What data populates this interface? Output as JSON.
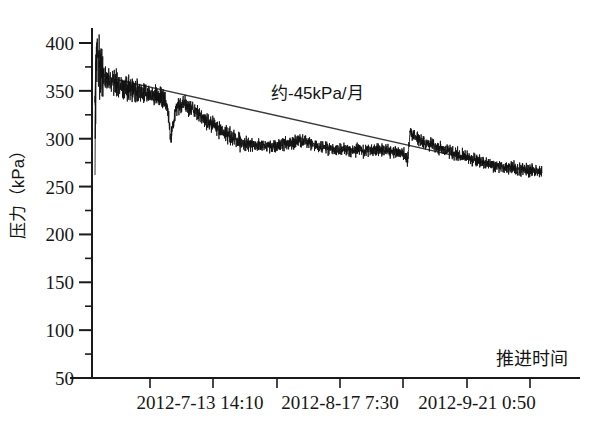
{
  "chart_data": {
    "type": "line",
    "title": "",
    "xlabel": "推进时间",
    "ylabel": "压力（kPa）",
    "ylim": [
      50,
      420
    ],
    "yticks": [
      400,
      350,
      300,
      250,
      200,
      150,
      100,
      50
    ],
    "y_minor_ticks": [
      375,
      325,
      275,
      225,
      175,
      125,
      75
    ],
    "grid": false,
    "legend": null,
    "xticks_labeled": [
      {
        "label": "2012-7-13 14:10",
        "px": 200
      },
      {
        "label": "2012-8-17 7:30",
        "px": 340
      },
      {
        "label": "2012-9-21 0:50",
        "px": 477
      }
    ],
    "x_tick_positions_px": [
      150,
      213,
      277,
      340,
      403,
      467,
      530
    ],
    "annotations": [
      {
        "text": "约-45kPa/月",
        "x_px": 271,
        "y_px": 79
      }
    ],
    "series": [
      {
        "name": "盾构土仓压力",
        "kind": "noisy-timeseries",
        "units": "kPa",
        "description": "初始峰值约390kPa，快速衰减后长期缓慢下降至约265kPa，带高频振荡",
        "control_points": [
          {
            "x_frac": 0.0,
            "value": 330
          },
          {
            "x_frac": 0.004,
            "value": 392
          },
          {
            "x_frac": 0.012,
            "value": 368
          },
          {
            "x_frac": 0.03,
            "value": 360
          },
          {
            "x_frac": 0.06,
            "value": 355
          },
          {
            "x_frac": 0.09,
            "value": 351
          },
          {
            "x_frac": 0.12,
            "value": 347
          },
          {
            "x_frac": 0.15,
            "value": 343
          },
          {
            "x_frac": 0.16,
            "value": 337
          },
          {
            "x_frac": 0.17,
            "value": 302
          },
          {
            "x_frac": 0.18,
            "value": 330
          },
          {
            "x_frac": 0.195,
            "value": 337
          },
          {
            "x_frac": 0.215,
            "value": 332
          },
          {
            "x_frac": 0.24,
            "value": 322
          },
          {
            "x_frac": 0.27,
            "value": 312
          },
          {
            "x_frac": 0.3,
            "value": 303
          },
          {
            "x_frac": 0.32,
            "value": 297
          },
          {
            "x_frac": 0.36,
            "value": 293
          },
          {
            "x_frac": 0.4,
            "value": 292
          },
          {
            "x_frac": 0.44,
            "value": 296
          },
          {
            "x_frac": 0.47,
            "value": 297
          },
          {
            "x_frac": 0.5,
            "value": 292
          },
          {
            "x_frac": 0.54,
            "value": 289
          },
          {
            "x_frac": 0.58,
            "value": 288
          },
          {
            "x_frac": 0.62,
            "value": 288
          },
          {
            "x_frac": 0.66,
            "value": 287
          },
          {
            "x_frac": 0.69,
            "value": 285
          },
          {
            "x_frac": 0.7,
            "value": 279
          },
          {
            "x_frac": 0.705,
            "value": 307
          },
          {
            "x_frac": 0.72,
            "value": 300
          },
          {
            "x_frac": 0.76,
            "value": 292
          },
          {
            "x_frac": 0.8,
            "value": 285
          },
          {
            "x_frac": 0.85,
            "value": 278
          },
          {
            "x_frac": 0.9,
            "value": 272
          },
          {
            "x_frac": 0.95,
            "value": 268
          },
          {
            "x_frac": 1.0,
            "value": 265
          }
        ],
        "noise_amplitude": 6.0
      },
      {
        "name": "趋势线",
        "kind": "trend-line",
        "units": "kPa",
        "slope_label": "约-45kPa/月",
        "start": {
          "x_frac": 0.046,
          "value": 362
        },
        "end": {
          "x_frac": 0.874,
          "value": 275
        }
      }
    ]
  },
  "axis": {
    "y_title": "压力（kPa）",
    "x_title": "推进时间",
    "tick_color": "#1a1a1a"
  },
  "colors": {
    "axis": "#1a1a1a",
    "data": "#111111",
    "trend": "#3a3a3a",
    "background": "#ffffff"
  }
}
